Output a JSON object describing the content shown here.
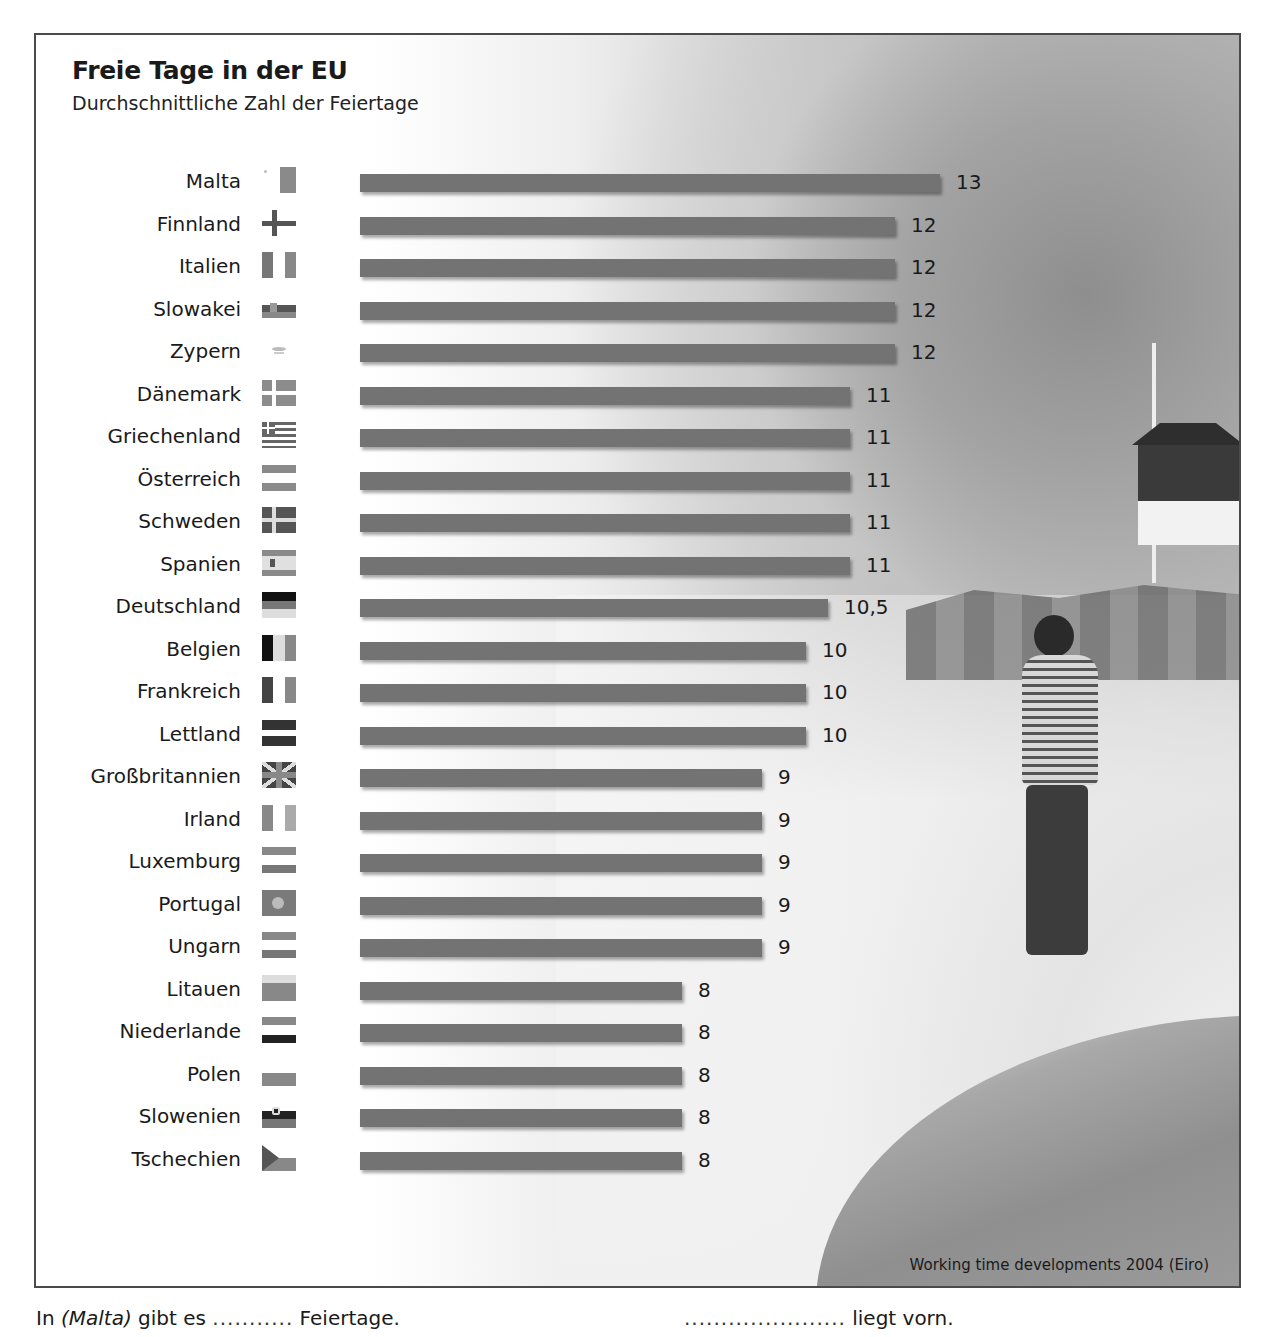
{
  "chart_data": {
    "type": "bar",
    "orientation": "horizontal",
    "title": "Freie Tage in der EU",
    "subtitle": "Durchschnittliche Zahl der Feiertage",
    "xlabel": "",
    "ylabel": "",
    "grid": false,
    "legend": null,
    "source": "Working time developments 2004 (Eiro)",
    "categories": [
      "Malta",
      "Finnland",
      "Italien",
      "Slowakei",
      "Zypern",
      "Dänemark",
      "Griechenland",
      "Österreich",
      "Schweden",
      "Spanien",
      "Deutschland",
      "Belgien",
      "Frankreich",
      "Lettland",
      "Großbritannien",
      "Irland",
      "Luxemburg",
      "Portugal",
      "Ungarn",
      "Litauen",
      "Niederlande",
      "Polen",
      "Slowenien",
      "Tschechien"
    ],
    "values": [
      13,
      12,
      12,
      12,
      12,
      11,
      11,
      11,
      11,
      11,
      10.5,
      10,
      10,
      10,
      9,
      9,
      9,
      9,
      9,
      8,
      8,
      8,
      8,
      8
    ],
    "value_labels": [
      "13",
      "12",
      "12",
      "12",
      "12",
      "11",
      "11",
      "11",
      "11",
      "11",
      "10,5",
      "10",
      "10",
      "10",
      "9",
      "9",
      "9",
      "9",
      "9",
      "8",
      "8",
      "8",
      "8",
      "8"
    ],
    "bar_color": "#737373"
  },
  "header": {
    "title": "Freie Tage in der EU",
    "subtitle": "Durchschnittliche Zahl der Feiertage"
  },
  "rows": [
    {
      "country": "Malta",
      "value": "13",
      "flag": "malta",
      "bar_px": 580
    },
    {
      "country": "Finnland",
      "value": "12",
      "flag": "finland",
      "bar_px": 535
    },
    {
      "country": "Italien",
      "value": "12",
      "flag": "italy",
      "bar_px": 535
    },
    {
      "country": "Slowakei",
      "value": "12",
      "flag": "slovakia",
      "bar_px": 535
    },
    {
      "country": "Zypern",
      "value": "12",
      "flag": "cyprus",
      "bar_px": 535
    },
    {
      "country": "Dänemark",
      "value": "11",
      "flag": "denmark",
      "bar_px": 490
    },
    {
      "country": "Griechenland",
      "value": "11",
      "flag": "greece",
      "bar_px": 490
    },
    {
      "country": "Österreich",
      "value": "11",
      "flag": "austria",
      "bar_px": 490
    },
    {
      "country": "Schweden",
      "value": "11",
      "flag": "sweden",
      "bar_px": 490
    },
    {
      "country": "Spanien",
      "value": "11",
      "flag": "spain",
      "bar_px": 490
    },
    {
      "country": "Deutschland",
      "value": "10,5",
      "flag": "germany",
      "bar_px": 468
    },
    {
      "country": "Belgien",
      "value": "10",
      "flag": "belgium",
      "bar_px": 446
    },
    {
      "country": "Frankreich",
      "value": "10",
      "flag": "france",
      "bar_px": 446
    },
    {
      "country": "Lettland",
      "value": "10",
      "flag": "latvia",
      "bar_px": 446
    },
    {
      "country": "Großbritannien",
      "value": "9",
      "flag": "uk",
      "bar_px": 402
    },
    {
      "country": "Irland",
      "value": "9",
      "flag": "ireland",
      "bar_px": 402
    },
    {
      "country": "Luxemburg",
      "value": "9",
      "flag": "luxembourg",
      "bar_px": 402
    },
    {
      "country": "Portugal",
      "value": "9",
      "flag": "portugal",
      "bar_px": 402
    },
    {
      "country": "Ungarn",
      "value": "9",
      "flag": "hungary",
      "bar_px": 402
    },
    {
      "country": "Litauen",
      "value": "8",
      "flag": "lithuania",
      "bar_px": 322
    },
    {
      "country": "Niederlande",
      "value": "8",
      "flag": "netherlands",
      "bar_px": 322
    },
    {
      "country": "Polen",
      "value": "8",
      "flag": "poland",
      "bar_px": 322
    },
    {
      "country": "Slowenien",
      "value": "8",
      "flag": "slovenia",
      "bar_px": 322
    },
    {
      "country": "Tschechien",
      "value": "8",
      "flag": "czechia",
      "bar_px": 322
    }
  ],
  "source": "Working time developments 2004 (Eiro)",
  "exercise": {
    "left_prefix": "In",
    "left_country": "(Malta)",
    "left_mid": "gibt es",
    "left_blank": "...........",
    "left_suffix": "Feiertage.",
    "right_blank": "......................",
    "right_suffix": "liegt vorn."
  }
}
